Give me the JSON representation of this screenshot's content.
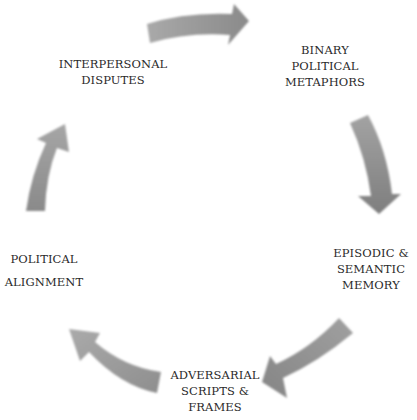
{
  "diagram": {
    "type": "cycle",
    "direction": "clockwise",
    "arrow_color": "#8c8c8c",
    "text_color": "#2a2a2a",
    "background": "#ffffff",
    "nodes": [
      {
        "id": "interpersonal-disputes",
        "lines": [
          "INTERPERSONAL",
          "DISPUTES"
        ]
      },
      {
        "id": "binary-political-metaphors",
        "lines": [
          "BINARY",
          "POLITICAL",
          "METAPHORS"
        ]
      },
      {
        "id": "episodic-semantic-memory",
        "lines": [
          "EPISODIC &",
          "SEMANTIC",
          "MEMORY"
        ]
      },
      {
        "id": "adversarial-scripts-frames",
        "lines": [
          "ADVERSARIAL",
          "SCRIPTS &",
          "FRAMES"
        ]
      },
      {
        "id": "political-alignment",
        "lines": [
          "POLITICAL",
          "ALIGNMENT"
        ]
      }
    ],
    "edges": [
      {
        "from": "interpersonal-disputes",
        "to": "binary-political-metaphors"
      },
      {
        "from": "binary-political-metaphors",
        "to": "episodic-semantic-memory"
      },
      {
        "from": "episodic-semantic-memory",
        "to": "adversarial-scripts-frames"
      },
      {
        "from": "adversarial-scripts-frames",
        "to": "political-alignment"
      },
      {
        "from": "political-alignment",
        "to": "interpersonal-disputes"
      }
    ]
  }
}
